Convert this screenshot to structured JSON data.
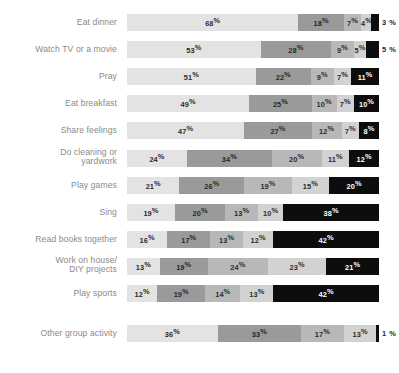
{
  "chart_data": {
    "type": "bar",
    "subtype": "horizontal-stacked-100",
    "title": "",
    "subtitle": "",
    "xlabel": "",
    "ylabel": "",
    "xlim": [
      0,
      100
    ],
    "grid": false,
    "legend_position": "none",
    "unit": "%",
    "categories": [
      "Eat dinner",
      "Watch TV or a movie",
      "Pray",
      "Eat breakfast",
      "Share feelings",
      "Do cleaning or\nyardwork",
      "Play games",
      "Sing",
      "Read books together",
      "Work on house/\nDIY projects",
      "Play sports",
      "Other group activity"
    ],
    "series": [
      {
        "name": "segment-1",
        "color": "#e3e3e3",
        "values": [
          68,
          53,
          51,
          49,
          47,
          24,
          21,
          19,
          16,
          13,
          12,
          36
        ]
      },
      {
        "name": "segment-2",
        "color": "#9a9a9a",
        "values": [
          18,
          28,
          22,
          25,
          27,
          34,
          26,
          20,
          17,
          19,
          19,
          33
        ]
      },
      {
        "name": "segment-3",
        "color": "#b8b8b8",
        "values": [
          7,
          9,
          9,
          10,
          12,
          20,
          19,
          13,
          13,
          24,
          14,
          17
        ]
      },
      {
        "name": "segment-4",
        "color": "#d2d2d2",
        "values": [
          4,
          5,
          7,
          7,
          7,
          11,
          15,
          10,
          12,
          23,
          13,
          13
        ]
      },
      {
        "name": "segment-5",
        "color": "#0d0d0d",
        "values": [
          3,
          5,
          11,
          10,
          8,
          12,
          20,
          38,
          42,
          21,
          42,
          1
        ]
      }
    ],
    "rows": [
      {
        "label": "Eat dinner",
        "segments": [
          {
            "value": 68,
            "label": "68",
            "shade": 0,
            "outside": false
          },
          {
            "value": 18,
            "label": "18",
            "shade": 1,
            "outside": false
          },
          {
            "value": 7,
            "label": "7",
            "shade": 2,
            "outside": false
          },
          {
            "value": 4,
            "label": "4",
            "shade": 3,
            "outside": false
          },
          {
            "value": 3,
            "label": "3",
            "shade": 4,
            "outside": true
          }
        ]
      },
      {
        "label": "Watch TV or a movie",
        "segments": [
          {
            "value": 53,
            "label": "53",
            "shade": 0,
            "outside": false
          },
          {
            "value": 28,
            "label": "28",
            "shade": 1,
            "outside": false
          },
          {
            "value": 9,
            "label": "9",
            "shade": 2,
            "outside": false
          },
          {
            "value": 5,
            "label": "5",
            "shade": 3,
            "outside": false
          },
          {
            "value": 5,
            "label": "5",
            "shade": 4,
            "outside": true
          }
        ]
      },
      {
        "label": "Pray",
        "segments": [
          {
            "value": 51,
            "label": "51",
            "shade": 0,
            "outside": false
          },
          {
            "value": 22,
            "label": "22",
            "shade": 1,
            "outside": false
          },
          {
            "value": 9,
            "label": "9",
            "shade": 2,
            "outside": false
          },
          {
            "value": 7,
            "label": "7",
            "shade": 3,
            "outside": false
          },
          {
            "value": 11,
            "label": "11",
            "shade": 4,
            "outside": false
          }
        ]
      },
      {
        "label": "Eat breakfast",
        "segments": [
          {
            "value": 49,
            "label": "49",
            "shade": 0,
            "outside": false
          },
          {
            "value": 25,
            "label": "25",
            "shade": 1,
            "outside": false
          },
          {
            "value": 10,
            "label": "10",
            "shade": 2,
            "outside": false
          },
          {
            "value": 7,
            "label": "7",
            "shade": 3,
            "outside": false
          },
          {
            "value": 10,
            "label": "10",
            "shade": 4,
            "outside": false
          }
        ]
      },
      {
        "label": "Share feelings",
        "segments": [
          {
            "value": 47,
            "label": "47",
            "shade": 0,
            "outside": false
          },
          {
            "value": 27,
            "label": "27",
            "shade": 1,
            "outside": false
          },
          {
            "value": 12,
            "label": "12",
            "shade": 2,
            "outside": false
          },
          {
            "value": 7,
            "label": "7",
            "shade": 3,
            "outside": false
          },
          {
            "value": 8,
            "label": "8",
            "shade": 4,
            "outside": false
          }
        ]
      },
      {
        "label": "Do cleaning or\nyardwork",
        "segments": [
          {
            "value": 24,
            "label": "24",
            "shade": 0,
            "outside": false
          },
          {
            "value": 34,
            "label": "34",
            "shade": 1,
            "outside": false
          },
          {
            "value": 20,
            "label": "20",
            "shade": 2,
            "outside": false
          },
          {
            "value": 11,
            "label": "11",
            "shade": 3,
            "outside": false
          },
          {
            "value": 12,
            "label": "12",
            "shade": 4,
            "outside": false
          }
        ]
      },
      {
        "label": "Play games",
        "segments": [
          {
            "value": 21,
            "label": "21",
            "shade": 0,
            "outside": false
          },
          {
            "value": 26,
            "label": "26",
            "shade": 1,
            "outside": false
          },
          {
            "value": 19,
            "label": "19",
            "shade": 2,
            "outside": false
          },
          {
            "value": 15,
            "label": "15",
            "shade": 3,
            "outside": false
          },
          {
            "value": 20,
            "label": "20",
            "shade": 4,
            "outside": false
          }
        ]
      },
      {
        "label": "Sing",
        "segments": [
          {
            "value": 19,
            "label": "19",
            "shade": 0,
            "outside": false
          },
          {
            "value": 20,
            "label": "20",
            "shade": 1,
            "outside": false
          },
          {
            "value": 13,
            "label": "13",
            "shade": 2,
            "outside": false
          },
          {
            "value": 10,
            "label": "10",
            "shade": 3,
            "outside": false
          },
          {
            "value": 38,
            "label": "38",
            "shade": 4,
            "outside": false
          }
        ]
      },
      {
        "label": "Read books together",
        "segments": [
          {
            "value": 16,
            "label": "16",
            "shade": 0,
            "outside": false
          },
          {
            "value": 17,
            "label": "17",
            "shade": 1,
            "outside": false
          },
          {
            "value": 13,
            "label": "13",
            "shade": 2,
            "outside": false
          },
          {
            "value": 12,
            "label": "12",
            "shade": 3,
            "outside": false
          },
          {
            "value": 42,
            "label": "42",
            "shade": 4,
            "outside": false
          }
        ]
      },
      {
        "label": "Work on house/\nDIY projects",
        "segments": [
          {
            "value": 13,
            "label": "13",
            "shade": 0,
            "outside": false
          },
          {
            "value": 19,
            "label": "19",
            "shade": 1,
            "outside": false
          },
          {
            "value": 24,
            "label": "24",
            "shade": 2,
            "outside": false
          },
          {
            "value": 23,
            "label": "23",
            "shade": 3,
            "outside": false
          },
          {
            "value": 21,
            "label": "21",
            "shade": 4,
            "outside": false
          }
        ]
      },
      {
        "label": "Play sports",
        "segments": [
          {
            "value": 12,
            "label": "12",
            "shade": 0,
            "outside": false
          },
          {
            "value": 19,
            "label": "19",
            "shade": 1,
            "outside": false
          },
          {
            "value": 14,
            "label": "14",
            "shade": 2,
            "outside": false
          },
          {
            "value": 13,
            "label": "13",
            "shade": 3,
            "outside": false
          },
          {
            "value": 42,
            "label": "42",
            "shade": 4,
            "outside": false
          }
        ]
      },
      {
        "label": "Other group activity",
        "segments": [
          {
            "value": 36,
            "label": "36",
            "shade": 0,
            "outside": false
          },
          {
            "value": 33,
            "label": "33",
            "shade": 1,
            "outside": false
          },
          {
            "value": 17,
            "label": "17",
            "shade": 2,
            "outside": false
          },
          {
            "value": 13,
            "label": "13",
            "shade": 3,
            "outside": false
          },
          {
            "value": 1,
            "label": "1",
            "shade": 4,
            "outside": true
          }
        ]
      }
    ]
  }
}
